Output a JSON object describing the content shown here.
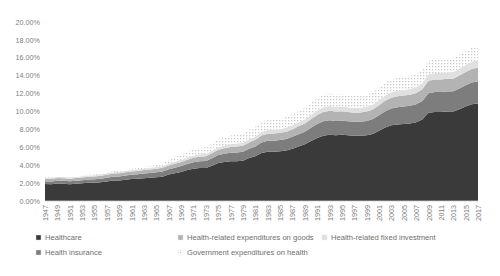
{
  "chart_data": {
    "type": "area",
    "title": "",
    "xlabel": "",
    "ylabel": "",
    "ylim": [
      0,
      20
    ],
    "ytick_labels": [
      "0.00%",
      "2.00%",
      "4.00%",
      "6.00%",
      "8.00%",
      "10.00%",
      "12.00%",
      "14.00%",
      "16.00%",
      "18.00%",
      "20.00%"
    ],
    "ytick_values": [
      0,
      2,
      4,
      6,
      8,
      10,
      12,
      14,
      16,
      18,
      20
    ],
    "grid": false,
    "stacked": true,
    "legend_position": "bottom",
    "categories": [
      1947,
      1948,
      1949,
      1950,
      1951,
      1952,
      1953,
      1954,
      1955,
      1956,
      1957,
      1958,
      1959,
      1960,
      1961,
      1962,
      1963,
      1964,
      1965,
      1966,
      1967,
      1968,
      1969,
      1970,
      1971,
      1972,
      1973,
      1974,
      1975,
      1976,
      1977,
      1978,
      1979,
      1980,
      1981,
      1982,
      1983,
      1984,
      1985,
      1986,
      1987,
      1988,
      1989,
      1990,
      1991,
      1992,
      1993,
      1994,
      1995,
      1996,
      1997,
      1998,
      1999,
      2000,
      2001,
      2002,
      2003,
      2004,
      2005,
      2006,
      2007,
      2008,
      2009,
      2010,
      2011,
      2012,
      2013,
      2014,
      2015,
      2016,
      2017
    ],
    "xtick_labels": [
      "1947",
      "1949",
      "1951",
      "1953",
      "1955",
      "1957",
      "1959",
      "1961",
      "1963",
      "1965",
      "1967",
      "1969",
      "1971",
      "1973",
      "1975",
      "1977",
      "1979",
      "1981",
      "1983",
      "1985",
      "1987",
      "1989",
      "1991",
      "1993",
      "1995",
      "1997",
      "1999",
      "2001",
      "2003",
      "2005",
      "2007",
      "2009",
      "2011",
      "2013",
      "2015",
      "2017"
    ],
    "series": [
      {
        "name": "Healthcare",
        "color": "#3a3a3a",
        "pattern": "solid",
        "values": [
          1.9,
          1.88,
          1.95,
          1.92,
          1.88,
          1.92,
          1.98,
          2.05,
          2.05,
          2.1,
          2.18,
          2.28,
          2.3,
          2.38,
          2.45,
          2.48,
          2.55,
          2.6,
          2.65,
          2.72,
          2.95,
          3.1,
          3.25,
          3.45,
          3.6,
          3.68,
          3.7,
          3.95,
          4.25,
          4.35,
          4.45,
          4.45,
          4.5,
          4.8,
          5.0,
          5.35,
          5.5,
          5.5,
          5.55,
          5.65,
          5.85,
          6.1,
          6.35,
          6.7,
          7.05,
          7.3,
          7.4,
          7.35,
          7.4,
          7.35,
          7.3,
          7.3,
          7.35,
          7.5,
          7.85,
          8.2,
          8.45,
          8.55,
          8.6,
          8.65,
          8.8,
          9.1,
          9.85,
          9.95,
          9.95,
          10.0,
          10.0,
          10.25,
          10.55,
          10.8,
          10.9
        ]
      },
      {
        "name": "Health insurance",
        "color": "#7d7d7d",
        "pattern": "solid",
        "values": [
          0.3,
          0.3,
          0.32,
          0.33,
          0.33,
          0.34,
          0.35,
          0.36,
          0.38,
          0.4,
          0.42,
          0.44,
          0.45,
          0.47,
          0.48,
          0.5,
          0.52,
          0.54,
          0.56,
          0.58,
          0.6,
          0.62,
          0.65,
          0.68,
          0.72,
          0.75,
          0.78,
          0.82,
          0.88,
          0.92,
          0.95,
          0.98,
          1.0,
          1.05,
          1.1,
          1.18,
          1.22,
          1.24,
          1.26,
          1.28,
          1.32,
          1.36,
          1.4,
          1.48,
          1.55,
          1.6,
          1.62,
          1.6,
          1.58,
          1.56,
          1.55,
          1.56,
          1.6,
          1.66,
          1.74,
          1.82,
          1.88,
          1.92,
          1.95,
          1.98,
          2.02,
          2.08,
          2.2,
          2.22,
          2.22,
          2.24,
          2.25,
          2.32,
          2.38,
          2.44,
          2.48
        ]
      },
      {
        "name": "Health-related expenditures on goods",
        "color": "#b3b3b3",
        "pattern": "solid",
        "values": [
          0.28,
          0.28,
          0.29,
          0.29,
          0.29,
          0.3,
          0.3,
          0.31,
          0.31,
          0.32,
          0.33,
          0.34,
          0.34,
          0.35,
          0.36,
          0.37,
          0.38,
          0.39,
          0.4,
          0.41,
          0.43,
          0.44,
          0.46,
          0.48,
          0.5,
          0.52,
          0.53,
          0.56,
          0.6,
          0.62,
          0.64,
          0.65,
          0.66,
          0.7,
          0.73,
          0.78,
          0.8,
          0.8,
          0.81,
          0.82,
          0.85,
          0.88,
          0.91,
          0.96,
          1.0,
          1.04,
          1.05,
          1.04,
          1.04,
          1.03,
          1.02,
          1.03,
          1.04,
          1.07,
          1.12,
          1.17,
          1.2,
          1.22,
          1.23,
          1.24,
          1.26,
          1.3,
          1.38,
          1.4,
          1.4,
          1.41,
          1.41,
          1.44,
          1.48,
          1.52,
          1.54
        ]
      },
      {
        "name": "Health-related fixed investment",
        "color": "#e0e0e0",
        "pattern": "solid",
        "values": [
          0.12,
          0.12,
          0.12,
          0.13,
          0.13,
          0.13,
          0.14,
          0.14,
          0.15,
          0.15,
          0.16,
          0.16,
          0.17,
          0.17,
          0.18,
          0.18,
          0.19,
          0.19,
          0.2,
          0.21,
          0.22,
          0.23,
          0.24,
          0.25,
          0.26,
          0.27,
          0.28,
          0.29,
          0.31,
          0.32,
          0.33,
          0.34,
          0.35,
          0.36,
          0.38,
          0.4,
          0.41,
          0.42,
          0.42,
          0.43,
          0.44,
          0.46,
          0.47,
          0.5,
          0.52,
          0.54,
          0.55,
          0.54,
          0.54,
          0.53,
          0.53,
          0.54,
          0.55,
          0.56,
          0.58,
          0.6,
          0.62,
          0.63,
          0.64,
          0.65,
          0.66,
          0.68,
          0.72,
          0.73,
          0.73,
          0.74,
          0.74,
          0.76,
          0.78,
          0.8,
          0.81
        ]
      },
      {
        "name": "Government expenditures on health",
        "color": "#f2f2f2",
        "pattern": "dotted",
        "values": [
          0.05,
          0.05,
          0.06,
          0.06,
          0.06,
          0.07,
          0.07,
          0.08,
          0.08,
          0.09,
          0.1,
          0.11,
          0.12,
          0.13,
          0.14,
          0.15,
          0.16,
          0.18,
          0.2,
          0.25,
          0.4,
          0.5,
          0.55,
          0.62,
          0.68,
          0.72,
          0.74,
          0.8,
          0.88,
          0.92,
          0.95,
          0.96,
          0.98,
          1.04,
          1.08,
          1.14,
          1.18,
          1.18,
          1.18,
          1.2,
          1.22,
          1.24,
          1.26,
          1.3,
          1.34,
          1.38,
          1.4,
          1.38,
          1.36,
          1.34,
          1.32,
          1.32,
          1.34,
          1.36,
          1.4,
          1.44,
          1.46,
          1.46,
          1.46,
          1.46,
          1.47,
          1.48,
          1.52,
          1.52,
          1.51,
          1.5,
          1.5,
          1.52,
          1.54,
          1.56,
          1.57
        ]
      }
    ]
  },
  "legend": {
    "items": [
      {
        "label": "Healthcare",
        "color": "#3a3a3a",
        "pattern": "solid"
      },
      {
        "label": "Health insurance",
        "color": "#7d7d7d",
        "pattern": "solid"
      },
      {
        "label": "Health-related expenditures on goods",
        "color": "#b3b3b3",
        "pattern": "solid"
      },
      {
        "label": "Health-related fixed investment",
        "color": "#e0e0e0",
        "pattern": "solid"
      },
      {
        "label": "Government expenditures on health",
        "color": "#f2f2f2",
        "pattern": "dotted"
      }
    ]
  }
}
